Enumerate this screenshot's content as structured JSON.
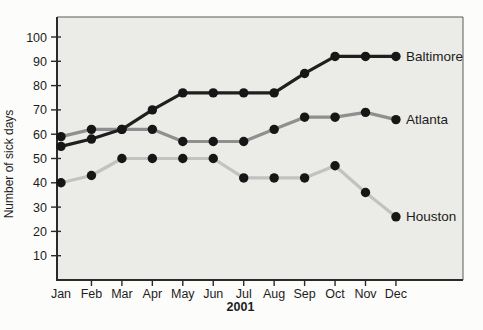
{
  "page": {
    "background_color": "#fcfcfb"
  },
  "chart_data": {
    "type": "line",
    "title": "",
    "xlabel": "2001",
    "ylabel": "Number of sick days",
    "categories": [
      "Jan",
      "Feb",
      "Mar",
      "Apr",
      "May",
      "Jun",
      "Jul",
      "Aug",
      "Sep",
      "Oct",
      "Nov",
      "Dec"
    ],
    "yticks": [
      10,
      20,
      30,
      40,
      50,
      60,
      70,
      80,
      90,
      100
    ],
    "ylim": [
      0,
      108
    ],
    "grid": false,
    "legend_position": "labels-at-line-end",
    "plot_bg": "#ebebe7",
    "marker_color": "#161616",
    "axis_color": "#2a2a2a",
    "border_color": "#5a5a5a",
    "series": [
      {
        "name": "Baltimore",
        "color": "#1f1f1f",
        "values": [
          55,
          58,
          62,
          70,
          77,
          77,
          77,
          77,
          85,
          92,
          92,
          92
        ]
      },
      {
        "name": "Atlanta",
        "color": "#8f8f8f",
        "values": [
          59,
          62,
          62,
          62,
          57,
          57,
          57,
          62,
          67,
          67,
          69,
          66
        ]
      },
      {
        "name": "Houston",
        "color": "#c2c2c0",
        "values": [
          40,
          43,
          50,
          50,
          50,
          50,
          42,
          42,
          42,
          47,
          36,
          26
        ]
      }
    ]
  }
}
